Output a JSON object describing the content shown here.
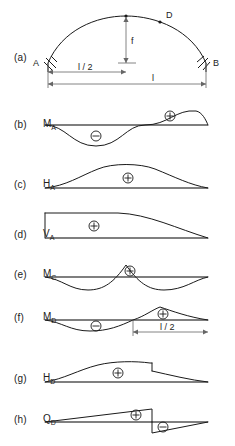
{
  "figure": {
    "width": 235,
    "height": 446,
    "line_color": "#1a1a1a",
    "baseline_color": "#555555",
    "dimension_color": "#666666"
  },
  "geometry": {
    "span_left_x": 45,
    "span_right_x": 208,
    "crown_x": 126,
    "baseline_extent": "A to B"
  },
  "panels": [
    {
      "key": "a",
      "tag": "(a)",
      "quantity": "",
      "subscript": "",
      "description": "arch geometry with supports A and B, crown, point D",
      "point_labels": [
        "A",
        "B",
        "D"
      ],
      "dimensions": [
        {
          "label": "f",
          "orientation": "vertical",
          "meaning": "arch rise"
        },
        {
          "label": "l / 2",
          "orientation": "horizontal",
          "meaning": "half span"
        },
        {
          "label": "l",
          "orientation": "horizontal",
          "meaning": "full span"
        }
      ],
      "signs": []
    },
    {
      "key": "b",
      "tag": "(b)",
      "quantity": "M",
      "subscript": "A",
      "description": "influence line for bending moment at support A, antisymmetric",
      "signs": [
        {
          "symbol": "minus",
          "glyph": "⊖",
          "x_frac": 0.32
        },
        {
          "symbol": "plus",
          "glyph": "⊕",
          "x_frac": 0.7
        }
      ]
    },
    {
      "key": "c",
      "tag": "(c)",
      "quantity": "H",
      "subscript": "A",
      "description": "influence line for horizontal thrust at A, single positive hump",
      "signs": [
        {
          "symbol": "plus",
          "glyph": "⊕",
          "x_frac": 0.52
        }
      ]
    },
    {
      "key": "d",
      "tag": "(d)",
      "quantity": "V",
      "subscript": "A",
      "description": "influence line for vertical reaction at A, unit at A falling to zero at B",
      "signs": [
        {
          "symbol": "plus",
          "glyph": "⊕",
          "x_frac": 0.3
        }
      ]
    },
    {
      "key": "e",
      "tag": "(e)",
      "quantity": "M",
      "subscript": "C",
      "description": "influence line for bending moment at crown C, positive peak at centre with negative side lobes",
      "signs": [
        {
          "symbol": "plus",
          "glyph": "⊕",
          "x_frac": 0.52
        }
      ]
    },
    {
      "key": "f",
      "tag": "(f)",
      "quantity": "M",
      "subscript": "D",
      "description": "influence line for bending moment at section D, negative left lobe and positive peak at D",
      "signs": [
        {
          "symbol": "minus",
          "glyph": "⊖",
          "x_frac": 0.33
        },
        {
          "symbol": "plus",
          "glyph": "⊕",
          "x_frac": 0.62
        }
      ],
      "dimensions": [
        {
          "label": "l / 2",
          "orientation": "horizontal",
          "meaning": "distance from D to B"
        }
      ]
    },
    {
      "key": "g",
      "tag": "(g)",
      "quantity": "H",
      "subscript": "D",
      "description": "influence line for horizontal force at D with a step discontinuity at D",
      "signs": [
        {
          "symbol": "plus",
          "glyph": "⊕",
          "x_frac": 0.45
        }
      ]
    },
    {
      "key": "h",
      "tag": "(h)",
      "quantity": "Q",
      "subscript": "D",
      "description": "influence line for shear at D, sawtooth with jump at D",
      "signs": [
        {
          "symbol": "plus",
          "glyph": "⊕",
          "x_frac": 0.6
        },
        {
          "symbol": "minus",
          "glyph": "⊖",
          "x_frac": 0.7
        }
      ]
    }
  ],
  "labels": {
    "tag_a": "(a)",
    "tag_b": "(b)",
    "tag_c": "(c)",
    "tag_d": "(d)",
    "tag_e": "(e)",
    "tag_f": "(f)",
    "tag_g": "(g)",
    "tag_h": "(h)",
    "point_a": "A",
    "point_b": "B",
    "point_d": "D",
    "rise_f": "f",
    "half_span": "l / 2",
    "full_span": "l",
    "half_span_f": "l / 2",
    "m_a": "M",
    "m_a_sub": "A",
    "h_a": "H",
    "h_a_sub": "A",
    "v_a": "V",
    "v_a_sub": "A",
    "m_c": "M",
    "m_c_sub": "C",
    "m_d": "M",
    "m_d_sub": "D",
    "h_d": "H",
    "h_d_sub": "D",
    "q_d": "Q",
    "q_d_sub": "D",
    "plus_sign": "+",
    "minus_sign": "−"
  }
}
